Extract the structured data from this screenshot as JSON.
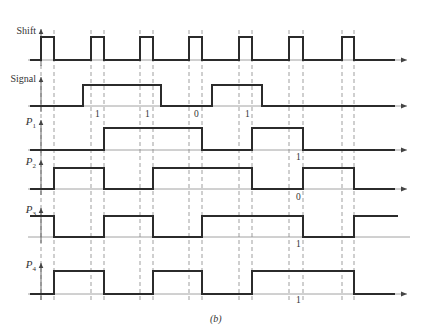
{
  "figure": {
    "caption": "(b)",
    "dash_x": [
      41,
      54,
      91,
      104,
      140,
      153,
      189,
      202,
      239,
      252,
      289,
      303,
      342,
      354
    ],
    "signals": [
      {
        "id": "shift",
        "label": "Shift",
        "sub": "",
        "baseline_y": 60,
        "high_y": 37,
        "x_start": 30,
        "x_end": 395,
        "arrow": true,
        "high_intervals": [
          [
            41,
            54
          ],
          [
            91,
            104
          ],
          [
            140,
            153
          ],
          [
            189,
            202
          ],
          [
            239,
            252
          ],
          [
            289,
            303
          ],
          [
            342,
            354
          ]
        ]
      },
      {
        "id": "signal",
        "label": "Signal",
        "sub": "",
        "baseline_y": 106,
        "high_y": 85,
        "x_start": 30,
        "x_end": 395,
        "arrow": true,
        "high_intervals": [
          [
            83,
            161
          ],
          [
            212,
            262
          ]
        ]
      },
      {
        "id": "p1",
        "label": "P",
        "sub": "1",
        "baseline_y": 150,
        "high_y": 128,
        "x_start": 30,
        "x_end": 395,
        "arrow": true,
        "high_intervals": [
          [
            104,
            202
          ],
          [
            252,
            303
          ]
        ]
      },
      {
        "id": "p2",
        "label": "P",
        "sub": "2",
        "baseline_y": 189,
        "high_y": 168,
        "x_start": 30,
        "x_end": 395,
        "arrow": true,
        "high_intervals": [
          [
            54,
            104
          ],
          [
            153,
            252
          ],
          [
            303,
            354
          ]
        ]
      },
      {
        "id": "p3",
        "label": "P",
        "sub": "3",
        "baseline_y": 237,
        "high_y": 216,
        "x_start": 30,
        "x_end": 398,
        "arrow": false,
        "high_intervals": [
          [
            30,
            54
          ],
          [
            104,
            153
          ],
          [
            202,
            303
          ],
          [
            354,
            398
          ]
        ]
      },
      {
        "id": "p4",
        "label": "P",
        "sub": "4",
        "baseline_y": 294,
        "high_y": 271,
        "x_start": 30,
        "x_end": 395,
        "arrow": true,
        "high_intervals": [
          [
            54,
            104
          ],
          [
            153,
            202
          ],
          [
            252,
            354
          ]
        ]
      }
    ],
    "bit_labels": [
      {
        "text": "1",
        "x": 95,
        "y": 117
      },
      {
        "text": "1",
        "x": 145,
        "y": 117
      },
      {
        "text": "0",
        "x": 194,
        "y": 117
      },
      {
        "text": "1",
        "x": 245,
        "y": 117
      },
      {
        "text": "1",
        "x": 296,
        "y": 160
      },
      {
        "text": "0",
        "x": 296,
        "y": 200
      },
      {
        "text": "1",
        "x": 296,
        "y": 247
      },
      {
        "text": "1",
        "x": 296,
        "y": 303
      }
    ]
  }
}
